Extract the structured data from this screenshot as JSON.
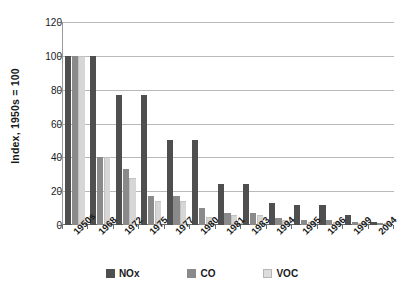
{
  "chart_data": {
    "type": "bar",
    "title": "",
    "xlabel": "",
    "ylabel": "Index, 1950s = 100",
    "ylim": [
      0,
      120
    ],
    "ytick_step": 20,
    "yticks": [
      0,
      20,
      40,
      60,
      80,
      100,
      120
    ],
    "grid": true,
    "legend_position": "bottom",
    "categories": [
      "1950s",
      "1968",
      "1972",
      "1975",
      "1977",
      "1980",
      "1981",
      "1983",
      "1994",
      "1995",
      "1996",
      "1999",
      "2004"
    ],
    "series": [
      {
        "name": "NOx",
        "color": "#4f4f4f",
        "values": [
          100,
          100,
          77,
          77,
          50,
          50,
          24,
          24,
          13,
          12,
          12,
          6,
          2
        ]
      },
      {
        "name": "CO",
        "color": "#8a8a8a",
        "values": [
          100,
          40,
          33,
          17,
          17,
          10,
          7,
          7,
          4,
          3,
          3,
          2,
          1
        ]
      },
      {
        "name": "VOC",
        "color": "#d6d6d6",
        "values": [
          100,
          40,
          28,
          14,
          14,
          5,
          6,
          6,
          3,
          2,
          2,
          1,
          1
        ]
      }
    ]
  },
  "legend": {
    "items": [
      {
        "label": "NOx",
        "swatch": "nox"
      },
      {
        "label": "CO",
        "swatch": "co"
      },
      {
        "label": "VOC",
        "swatch": "voc"
      }
    ]
  }
}
